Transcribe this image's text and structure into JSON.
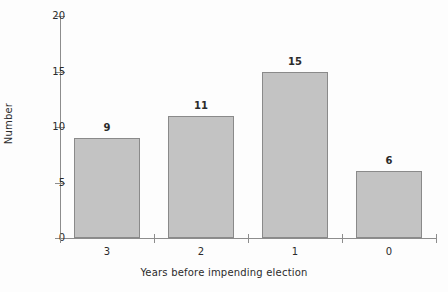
{
  "chart_data": {
    "type": "bar",
    "title": "",
    "xlabel": "Years before impending election",
    "ylabel": "Number",
    "categories": [
      "3",
      "2",
      "1",
      "0"
    ],
    "values": [
      9,
      11,
      15,
      6
    ],
    "ylim": [
      0,
      20
    ],
    "yticks": [
      0,
      5,
      10,
      15,
      20
    ],
    "ytick_labels": [
      "0",
      "5",
      "10",
      "15",
      "20"
    ],
    "grid": false,
    "legend": "none",
    "bar_labels": [
      "9",
      "11",
      "15",
      "6"
    ],
    "colors": {
      "bar_fill": "#c3c3c3",
      "bar_stroke": "#8a8a8a",
      "axis": "#8d8d8d",
      "text": "#2b2b2b",
      "background": "#fdfdfd"
    }
  }
}
